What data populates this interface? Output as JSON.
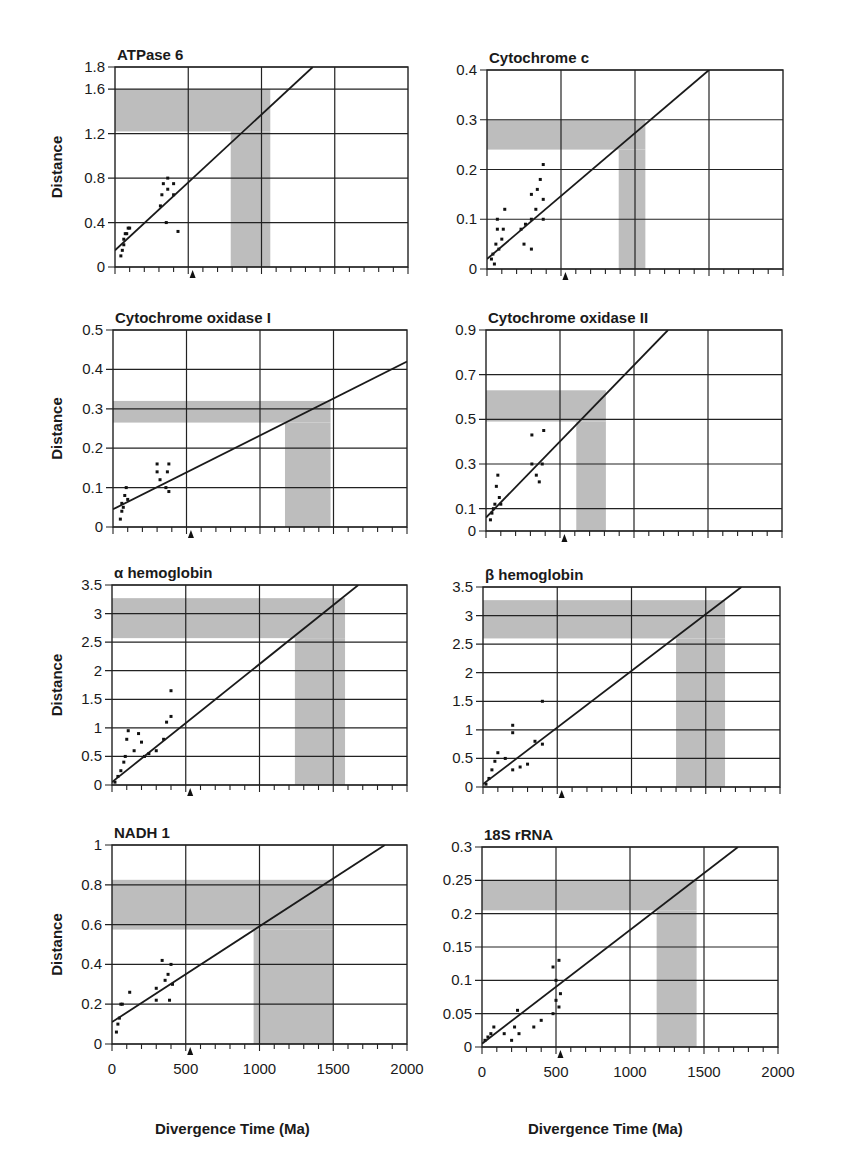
{
  "figure": {
    "xlabel": "Divergence Time (Ma)",
    "ylabel": "Distance",
    "x_ticks": [
      "0",
      "500",
      "1000",
      "1500",
      "2000"
    ],
    "calibration_marker_ma": 530,
    "shade_color": "#bdbdbd",
    "line_color": "#1a1a1a"
  },
  "chart_data": [
    {
      "type": "scatter",
      "title": "ATPase 6",
      "xlabel": "Divergence Time (Ma)",
      "ylabel": "Distance",
      "xlim": [
        0,
        2000
      ],
      "ylim": [
        0,
        1.8
      ],
      "y_ticks": [
        0,
        0.4,
        0.8,
        1.2,
        1.6,
        1.8
      ],
      "y_tick_labels": [
        "0",
        "0.4",
        "0.8",
        "1.2",
        "1.6",
        "1.8"
      ],
      "grid": true,
      "regression_line": {
        "x": [
          0,
          1350
        ],
        "y": [
          0.15,
          1.8
        ]
      },
      "shaded_y_band": [
        1.22,
        1.6
      ],
      "shaded_x_band": [
        790,
        1060
      ],
      "points": [
        [
          40,
          0.1
        ],
        [
          50,
          0.15
        ],
        [
          60,
          0.2
        ],
        [
          60,
          0.25
        ],
        [
          70,
          0.3
        ],
        [
          80,
          0.3
        ],
        [
          90,
          0.35
        ],
        [
          100,
          0.35
        ],
        [
          310,
          0.55
        ],
        [
          320,
          0.65
        ],
        [
          330,
          0.75
        ],
        [
          360,
          0.7
        ],
        [
          360,
          0.8
        ],
        [
          400,
          0.65
        ],
        [
          400,
          0.75
        ],
        [
          350,
          0.4
        ],
        [
          430,
          0.32
        ]
      ]
    },
    {
      "type": "scatter",
      "title": "Cytochrome c",
      "xlabel": "Divergence Time (Ma)",
      "ylabel": "Distance",
      "xlim": [
        0,
        2000
      ],
      "ylim": [
        0,
        0.4
      ],
      "y_ticks": [
        0,
        0.1,
        0.2,
        0.3,
        0.4
      ],
      "y_tick_labels": [
        "0",
        "0.1",
        "0.2",
        "0.3",
        "0.4"
      ],
      "grid": true,
      "regression_line": {
        "x": [
          0,
          1500
        ],
        "y": [
          0.02,
          0.4
        ]
      },
      "shaded_y_band": [
        0.24,
        0.3
      ],
      "shaded_x_band": [
        890,
        1070
      ],
      "points": [
        [
          30,
          0.02
        ],
        [
          40,
          0.03
        ],
        [
          50,
          0.01
        ],
        [
          60,
          0.05
        ],
        [
          70,
          0.08
        ],
        [
          70,
          0.1
        ],
        [
          80,
          0.04
        ],
        [
          100,
          0.06
        ],
        [
          110,
          0.08
        ],
        [
          120,
          0.12
        ],
        [
          230,
          0.08
        ],
        [
          250,
          0.05
        ],
        [
          260,
          0.09
        ],
        [
          300,
          0.04
        ],
        [
          300,
          0.1
        ],
        [
          300,
          0.15
        ],
        [
          330,
          0.12
        ],
        [
          340,
          0.16
        ],
        [
          360,
          0.18
        ],
        [
          380,
          0.1
        ],
        [
          380,
          0.14
        ],
        [
          380,
          0.21
        ]
      ]
    },
    {
      "type": "scatter",
      "title": "Cytochrome oxidase I",
      "xlabel": "Divergence Time (Ma)",
      "ylabel": "Distance",
      "xlim": [
        0,
        2000
      ],
      "ylim": [
        0,
        0.5
      ],
      "y_ticks": [
        0,
        0.1,
        0.2,
        0.3,
        0.4,
        0.5
      ],
      "y_tick_labels": [
        "0",
        "0.1",
        "0.2",
        "0.3",
        "0.4",
        "0.5"
      ],
      "grid": true,
      "regression_line": {
        "x": [
          0,
          2000
        ],
        "y": [
          0.045,
          0.42
        ]
      },
      "shaded_y_band": [
        0.265,
        0.32
      ],
      "shaded_x_band": [
        1170,
        1480
      ],
      "points": [
        [
          50,
          0.02
        ],
        [
          60,
          0.04
        ],
        [
          60,
          0.06
        ],
        [
          70,
          0.05
        ],
        [
          80,
          0.08
        ],
        [
          90,
          0.1
        ],
        [
          100,
          0.07
        ],
        [
          300,
          0.14
        ],
        [
          300,
          0.16
        ],
        [
          320,
          0.12
        ],
        [
          360,
          0.1
        ],
        [
          370,
          0.14
        ],
        [
          380,
          0.16
        ],
        [
          380,
          0.09
        ]
      ]
    },
    {
      "type": "scatter",
      "title": "Cytochrome oxidase II",
      "xlabel": "Divergence Time (Ma)",
      "ylabel": "Distance",
      "xlim": [
        0,
        2000
      ],
      "ylim": [
        0,
        0.9
      ],
      "y_ticks": [
        0,
        0.1,
        0.3,
        0.5,
        0.7,
        0.9
      ],
      "y_tick_labels": [
        "0",
        "0.1",
        "0.3",
        "0.5",
        "0.7",
        "0.9"
      ],
      "grid": true,
      "regression_line": {
        "x": [
          0,
          1230
        ],
        "y": [
          0.06,
          0.9
        ]
      },
      "shaded_y_band": [
        0.49,
        0.63
      ],
      "shaded_x_band": [
        610,
        810
      ],
      "points": [
        [
          30,
          0.05
        ],
        [
          40,
          0.08
        ],
        [
          50,
          0.1
        ],
        [
          60,
          0.12
        ],
        [
          70,
          0.2
        ],
        [
          80,
          0.25
        ],
        [
          90,
          0.15
        ],
        [
          100,
          0.12
        ],
        [
          310,
          0.3
        ],
        [
          310,
          0.43
        ],
        [
          340,
          0.25
        ],
        [
          360,
          0.22
        ],
        [
          380,
          0.3
        ],
        [
          390,
          0.45
        ]
      ]
    },
    {
      "type": "scatter",
      "title": "α hemoglobin",
      "xlabel": "Divergence Time (Ma)",
      "ylabel": "Distance",
      "xlim": [
        0,
        2000
      ],
      "ylim": [
        0,
        3.5
      ],
      "y_ticks": [
        0,
        0.5,
        1,
        1.5,
        2,
        2.5,
        3,
        3.5
      ],
      "y_tick_labels": [
        "0",
        "0.5",
        "1",
        "1.5",
        "2",
        "2.5",
        "3",
        "3.5"
      ],
      "grid": true,
      "regression_line": {
        "x": [
          0,
          1670
        ],
        "y": [
          0.05,
          3.5
        ]
      },
      "shaded_y_band": [
        2.57,
        3.27
      ],
      "shaded_x_band": [
        1240,
        1580
      ],
      "points": [
        [
          20,
          0.05
        ],
        [
          40,
          0.15
        ],
        [
          60,
          0.25
        ],
        [
          80,
          0.4
        ],
        [
          90,
          0.5
        ],
        [
          100,
          0.8
        ],
        [
          110,
          0.95
        ],
        [
          150,
          0.6
        ],
        [
          180,
          0.9
        ],
        [
          200,
          0.75
        ],
        [
          220,
          0.5
        ],
        [
          250,
          0.55
        ],
        [
          300,
          0.6
        ],
        [
          350,
          0.8
        ],
        [
          370,
          1.1
        ],
        [
          400,
          1.2
        ],
        [
          400,
          1.65
        ]
      ]
    },
    {
      "type": "scatter",
      "title": "β hemoglobin",
      "xlabel": "Divergence Time (Ma)",
      "ylabel": "Distance",
      "xlim": [
        0,
        2000
      ],
      "ylim": [
        0,
        3.5
      ],
      "y_ticks": [
        0,
        0.5,
        1,
        1.5,
        2,
        2.5,
        3,
        3.5
      ],
      "y_tick_labels": [
        "0",
        "0.5",
        "1",
        "1.5",
        "2",
        "2.5",
        "3",
        "3.5"
      ],
      "grid": true,
      "regression_line": {
        "x": [
          0,
          1740
        ],
        "y": [
          0.05,
          3.5
        ]
      },
      "shaded_y_band": [
        2.6,
        3.27
      ],
      "shaded_x_band": [
        1300,
        1630
      ],
      "points": [
        [
          20,
          0.05
        ],
        [
          40,
          0.15
        ],
        [
          60,
          0.3
        ],
        [
          80,
          0.45
        ],
        [
          100,
          0.6
        ],
        [
          150,
          0.5
        ],
        [
          200,
          0.3
        ],
        [
          200,
          0.95
        ],
        [
          200,
          1.08
        ],
        [
          250,
          0.35
        ],
        [
          300,
          0.4
        ],
        [
          350,
          0.8
        ],
        [
          400,
          0.75
        ],
        [
          400,
          1.5
        ]
      ]
    },
    {
      "type": "scatter",
      "title": "NADH 1",
      "xlabel": "Divergence Time (Ma)",
      "ylabel": "Distance",
      "xlim": [
        0,
        2000
      ],
      "ylim": [
        0,
        1
      ],
      "y_ticks": [
        0,
        0.2,
        0.4,
        0.6,
        0.8,
        1
      ],
      "y_tick_labels": [
        "0",
        "0.2",
        "0.4",
        "0.6",
        "0.8",
        "1"
      ],
      "grid": true,
      "regression_line": {
        "x": [
          0,
          1850
        ],
        "y": [
          0.11,
          1.0
        ]
      },
      "shaded_y_band": [
        0.575,
        0.825
      ],
      "shaded_x_band": [
        960,
        1500
      ],
      "points": [
        [
          30,
          0.06
        ],
        [
          40,
          0.1
        ],
        [
          50,
          0.13
        ],
        [
          60,
          0.2
        ],
        [
          70,
          0.2
        ],
        [
          120,
          0.26
        ],
        [
          300,
          0.22
        ],
        [
          300,
          0.28
        ],
        [
          340,
          0.42
        ],
        [
          360,
          0.32
        ],
        [
          380,
          0.35
        ],
        [
          390,
          0.22
        ],
        [
          400,
          0.4
        ],
        [
          410,
          0.3
        ]
      ]
    },
    {
      "type": "scatter",
      "title": "18S rRNA",
      "xlabel": "Divergence Time (Ma)",
      "ylabel": "Distance",
      "xlim": [
        0,
        2000
      ],
      "ylim": [
        0,
        0.3
      ],
      "y_ticks": [
        0,
        0.05,
        0.1,
        0.15,
        0.2,
        0.25,
        0.3
      ],
      "y_tick_labels": [
        "0",
        "0.05",
        "0.1",
        "0.15",
        "0.2",
        "0.25",
        "0.3"
      ],
      "grid": true,
      "regression_line": {
        "x": [
          0,
          1730
        ],
        "y": [
          0.005,
          0.3
        ]
      },
      "shaded_y_band": [
        0.205,
        0.25
      ],
      "shaded_x_band": [
        1180,
        1450
      ],
      "points": [
        [
          20,
          0.01
        ],
        [
          40,
          0.015
        ],
        [
          60,
          0.02
        ],
        [
          80,
          0.03
        ],
        [
          150,
          0.02
        ],
        [
          200,
          0.01
        ],
        [
          220,
          0.03
        ],
        [
          240,
          0.055
        ],
        [
          250,
          0.02
        ],
        [
          350,
          0.03
        ],
        [
          400,
          0.04
        ],
        [
          480,
          0.05
        ],
        [
          480,
          0.12
        ],
        [
          500,
          0.07
        ],
        [
          500,
          0.1
        ],
        [
          520,
          0.06
        ],
        [
          520,
          0.13
        ],
        [
          530,
          0.08
        ]
      ]
    }
  ]
}
